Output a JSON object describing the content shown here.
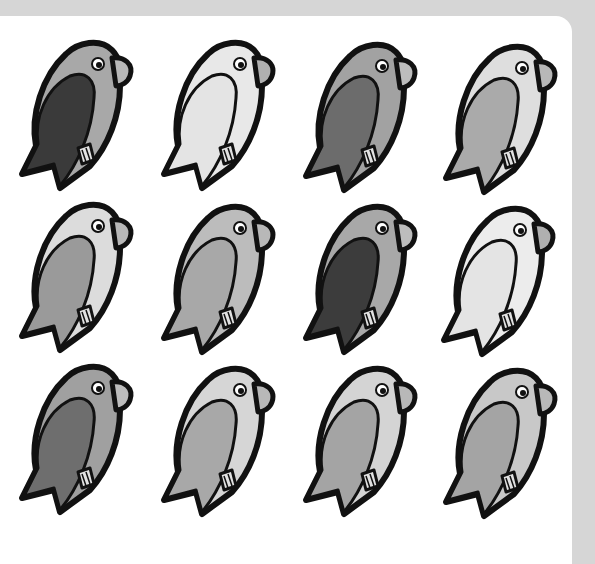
{
  "page": {
    "background": "#d6d6d6",
    "card_color": "#ffffff",
    "outline_color": "#111111"
  },
  "birds": [
    {
      "row": 0,
      "col": 0,
      "x": 8,
      "y": 36,
      "body": "#a8a8a8",
      "wing": "#3a3a3a",
      "beak": "#b8b8b8",
      "feet": "#e2e2e2"
    },
    {
      "row": 0,
      "col": 1,
      "x": 150,
      "y": 36,
      "body": "#e8e8e8",
      "wing": "#e4e4e4",
      "beak": "#b0b0b0",
      "feet": "#e2e2e2"
    },
    {
      "row": 0,
      "col": 2,
      "x": 292,
      "y": 38,
      "body": "#a2a2a2",
      "wing": "#6c6c6c",
      "beak": "#bdbdbd",
      "feet": "#e2e2e2"
    },
    {
      "row": 0,
      "col": 3,
      "x": 432,
      "y": 40,
      "body": "#dedede",
      "wing": "#aaaaaa",
      "beak": "#b8b8b8",
      "feet": "#e2e2e2"
    },
    {
      "row": 1,
      "col": 0,
      "x": 8,
      "y": 198,
      "body": "#dcdcdc",
      "wing": "#9a9a9a",
      "beak": "#b8b8b8",
      "feet": "#e2e2e2"
    },
    {
      "row": 1,
      "col": 1,
      "x": 150,
      "y": 200,
      "body": "#bcbcbc",
      "wing": "#a8a8a8",
      "beak": "#b8b8b8",
      "feet": "#e2e2e2"
    },
    {
      "row": 1,
      "col": 2,
      "x": 292,
      "y": 200,
      "body": "#a8a8a8",
      "wing": "#3c3c3c",
      "beak": "#bdbdbd",
      "feet": "#e2e2e2"
    },
    {
      "row": 1,
      "col": 3,
      "x": 430,
      "y": 202,
      "body": "#ececec",
      "wing": "#e4e4e4",
      "beak": "#b0b0b0",
      "feet": "#e2e2e2"
    },
    {
      "row": 2,
      "col": 0,
      "x": 8,
      "y": 360,
      "body": "#a0a0a0",
      "wing": "#6e6e6e",
      "beak": "#bdbdbd",
      "feet": "#e2e2e2"
    },
    {
      "row": 2,
      "col": 1,
      "x": 150,
      "y": 362,
      "body": "#d6d6d6",
      "wing": "#a8a8a8",
      "beak": "#b8b8b8",
      "feet": "#e2e2e2"
    },
    {
      "row": 2,
      "col": 2,
      "x": 292,
      "y": 362,
      "body": "#d4d4d4",
      "wing": "#a4a4a4",
      "beak": "#b8b8b8",
      "feet": "#e2e2e2"
    },
    {
      "row": 2,
      "col": 3,
      "x": 432,
      "y": 364,
      "body": "#c8c8c8",
      "wing": "#a4a4a4",
      "beak": "#b8b8b8",
      "feet": "#e2e2e2"
    }
  ]
}
